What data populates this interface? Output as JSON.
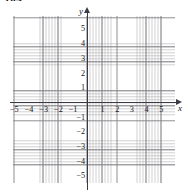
{
  "problem": {
    "number": "104"
  },
  "figure": {
    "type": "cartesian-grid",
    "axes": {
      "x": {
        "name": "x",
        "min": -5.5,
        "max": -5.5,
        "arrow": "right"
      },
      "y": {
        "name": "y",
        "min": -5.7,
        "max": 5.6,
        "arrow": "up"
      }
    },
    "x_ticks": [
      {
        "label": "−5",
        "value": -5
      },
      {
        "label": "−4",
        "value": -4
      },
      {
        "label": "−3",
        "value": -3
      },
      {
        "label": "−2",
        "value": -2
      },
      {
        "label": "−1",
        "value": -1
      },
      {
        "label": "1",
        "value": 1
      },
      {
        "label": "2",
        "value": 2
      },
      {
        "label": "3",
        "value": 3
      },
      {
        "label": "4",
        "value": 4
      },
      {
        "label": "5",
        "value": 5
      }
    ],
    "y_ticks": [
      {
        "label": "5",
        "value": 5
      },
      {
        "label": "4",
        "value": 4
      },
      {
        "label": "3",
        "value": 3
      },
      {
        "label": "2",
        "value": 2
      },
      {
        "label": "1",
        "value": 1
      },
      {
        "label": "−1",
        "value": -1
      },
      {
        "label": "−2",
        "value": -2
      },
      {
        "label": "−3",
        "value": -3
      },
      {
        "label": "−4",
        "value": -4
      },
      {
        "label": "−5",
        "value": -5
      }
    ],
    "grid": {
      "major_spacing": 1,
      "minor_per_major": 5,
      "major_color": "#696970",
      "minor_color": "#787880",
      "axis_color": "#3a3a42"
    }
  }
}
